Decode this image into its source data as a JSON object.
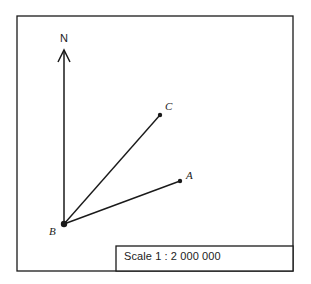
{
  "diagram": {
    "north_label": "N",
    "points": {
      "A": {
        "label": "A"
      },
      "B": {
        "label": "B"
      },
      "C": {
        "label": "C"
      }
    },
    "scale_text": "Scale 1 : 2 000 000",
    "line_color": "#1a1a1a",
    "background": "#ffffff"
  }
}
